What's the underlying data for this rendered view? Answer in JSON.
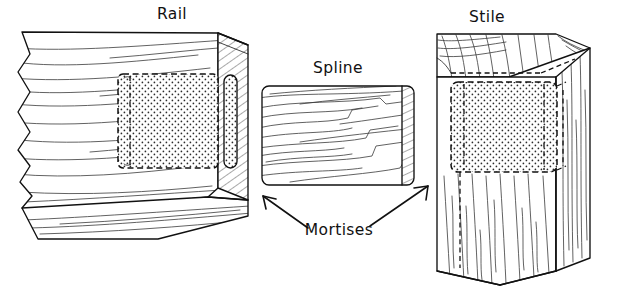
{
  "figure": {
    "type": "technical-line-drawing",
    "background_color": "#ffffff",
    "line_color": "#111111",
    "width": 623,
    "height": 301
  },
  "labels": {
    "rail": "Rail",
    "spline": "Spline",
    "stile": "Stile",
    "mortises": "Mortises"
  },
  "parts": [
    {
      "id": "rail",
      "label": "Rail",
      "description": "Horizontal board shown in perspective with broken-away left end, hatched end-grain face at right and a hidden stippled mortise",
      "features": [
        "broken-edge-left",
        "hatched-end-grain",
        "hidden-mortise-dashed",
        "stipple-fill",
        "grain-lines-horizontal"
      ]
    },
    {
      "id": "spline",
      "label": "Spline",
      "description": "Flat rectangular loose tenon with rounded corners, horizontal grain and hatched right end",
      "features": [
        "rounded-rectangle",
        "hatched-end",
        "grain-lines-horizontal"
      ]
    },
    {
      "id": "stile",
      "label": "Stile",
      "description": "Vertical board shown in perspective with visible top face, hidden stippled mortise and broken-away bottom end",
      "features": [
        "top-face-visible",
        "hidden-mortise-dashed",
        "stipple-fill",
        "grain-lines-vertical",
        "broken-edge-bottom"
      ]
    }
  ],
  "annotations": [
    {
      "text": "Mortises",
      "arrow_count": 2,
      "arrow_targets": [
        "rail-mortise",
        "stile-mortise"
      ],
      "arrow_directions": [
        "up-left",
        "up-right"
      ]
    }
  ]
}
